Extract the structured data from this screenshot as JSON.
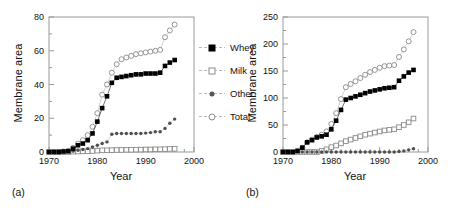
{
  "figure": {
    "panels": [
      {
        "tag": "(a)",
        "xlabel": "Year",
        "ylabel": "Membrane area"
      },
      {
        "tag": "(b)",
        "xlabel": "Year",
        "ylabel": "Membrane area"
      }
    ],
    "legend": {
      "entries": [
        {
          "label": "Whey",
          "marker": "filled-square",
          "color": "#000000"
        },
        {
          "label": "Milk",
          "marker": "open-square",
          "color": "#8a8a8a"
        },
        {
          "label": "Other",
          "marker": "filled-circle",
          "color": "#555555"
        },
        {
          "label": "Total",
          "marker": "open-circle",
          "color": "#8a8a8a"
        }
      ]
    }
  },
  "chart_data": [
    {
      "type": "line",
      "panel": "(a)",
      "title": "",
      "xlabel": "Year",
      "ylabel": "Membrane area",
      "xlim": [
        1970,
        2000
      ],
      "ylim": [
        0,
        80
      ],
      "xticks": [
        1970,
        1980,
        1990,
        2000
      ],
      "yticks": [
        0,
        20,
        40,
        60,
        80
      ],
      "xminor_step": 2,
      "yminor_step": 10,
      "grid": false,
      "legend_position": "right-outside",
      "x": [
        1970,
        1971,
        1972,
        1973,
        1974,
        1975,
        1976,
        1977,
        1978,
        1979,
        1980,
        1981,
        1982,
        1983,
        1984,
        1985,
        1986,
        1987,
        1988,
        1989,
        1990,
        1991,
        1992,
        1993,
        1994,
        1995,
        1996
      ],
      "series": [
        {
          "name": "Whey",
          "marker": "filled-square",
          "color": "#000000",
          "values": [
            0,
            0,
            0,
            0.3,
            0.5,
            2,
            4,
            5,
            7,
            11,
            18,
            26,
            33,
            41,
            44,
            44.5,
            45,
            45.5,
            46,
            46,
            46.5,
            46.5,
            46.5,
            47,
            51,
            53,
            54.5
          ]
        },
        {
          "name": "Milk",
          "marker": "open-square",
          "color": "#8a8a8a",
          "values": [
            0,
            0,
            0,
            0,
            0,
            0.2,
            0.3,
            0.4,
            0.5,
            0.6,
            0.8,
            1,
            1,
            1.1,
            1.2,
            1.2,
            1.3,
            1.3,
            1.4,
            1.4,
            1.5,
            1.5,
            1.6,
            1.6,
            1.7,
            1.8,
            1.9
          ]
        },
        {
          "name": "Other",
          "marker": "filled-circle",
          "color": "#555555",
          "values": [
            0,
            0,
            0,
            0,
            0.2,
            0.5,
            1,
            1.5,
            2,
            3,
            4,
            5,
            6,
            10.5,
            11,
            11,
            11,
            11,
            11,
            11,
            11.2,
            11.5,
            12,
            12,
            14,
            17,
            19.5
          ]
        },
        {
          "name": "Total",
          "marker": "open-circle",
          "color": "#8a8a8a",
          "values": [
            0,
            0,
            0,
            0.3,
            0.7,
            2.5,
            5,
            7,
            10,
            15,
            23,
            34,
            40,
            47,
            52,
            55,
            56,
            57,
            58,
            58.5,
            59,
            59.5,
            60,
            60.5,
            68,
            72,
            75.5
          ]
        }
      ]
    },
    {
      "type": "line",
      "panel": "(b)",
      "title": "",
      "xlabel": "Year",
      "ylabel": "Membrane area",
      "xlim": [
        1970,
        2000
      ],
      "ylim": [
        0,
        250
      ],
      "xticks": [
        1970,
        1980,
        1990,
        2000
      ],
      "yticks": [
        0,
        50,
        100,
        150,
        200,
        250
      ],
      "xminor_step": 2,
      "yminor_step": 25,
      "grid": false,
      "legend_position": "left-outside",
      "x": [
        1970,
        1971,
        1972,
        1973,
        1974,
        1975,
        1976,
        1977,
        1978,
        1979,
        1980,
        1981,
        1982,
        1983,
        1984,
        1985,
        1986,
        1987,
        1988,
        1989,
        1990,
        1991,
        1992,
        1993,
        1994,
        1995,
        1996,
        1997
      ],
      "series": [
        {
          "name": "Whey",
          "marker": "filled-square",
          "color": "#000000",
          "values": [
            0,
            0,
            0,
            2,
            8,
            18,
            22,
            27,
            29,
            32,
            42,
            58,
            78,
            97,
            100,
            103,
            106,
            109,
            112,
            114,
            116,
            118,
            119,
            120,
            132,
            140,
            147,
            152
          ]
        },
        {
          "name": "Milk",
          "marker": "open-square",
          "color": "#8a8a8a",
          "values": [
            0,
            0,
            0,
            0,
            0,
            0,
            0,
            0,
            2,
            5,
            9,
            12,
            16,
            20,
            23,
            26,
            29,
            32,
            34,
            36,
            38,
            40,
            41,
            42,
            46,
            50,
            55,
            62
          ]
        },
        {
          "name": "Other",
          "marker": "filled-circle",
          "color": "#555555",
          "values": [
            0,
            0,
            0,
            0,
            0,
            0,
            0,
            0,
            0,
            0,
            0,
            0,
            0,
            0,
            0,
            0,
            0,
            0,
            0,
            0,
            0,
            0,
            0,
            0,
            1,
            2,
            4,
            6
          ]
        },
        {
          "name": "Total",
          "marker": "open-circle",
          "color": "#8a8a8a",
          "values": [
            0,
            0,
            0,
            2,
            8,
            18,
            23,
            28,
            32,
            38,
            52,
            72,
            98,
            120,
            126,
            131,
            137,
            143,
            148,
            152,
            156,
            159,
            160,
            161,
            176,
            190,
            205,
            222
          ]
        }
      ]
    }
  ]
}
